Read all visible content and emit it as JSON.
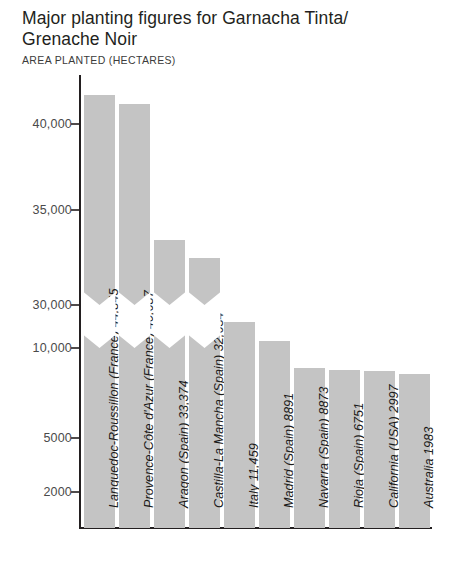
{
  "header": {
    "title": "Major planting figures for Garnacha Tinta/\nGrenache Noir",
    "subtitle": "AREA PLANTED (HECTARES)"
  },
  "colors": {
    "bar_fill": "#c4c4c4",
    "axis": "#231f20",
    "tick_label": "#4a4a4a",
    "background": "#ffffff",
    "title": "#231f20"
  },
  "axis": {
    "y_ticks": [
      {
        "label": "40,000",
        "value": 40000,
        "y": 124
      },
      {
        "label": "35,000",
        "value": 35000,
        "y": 210
      },
      {
        "label": "30,000",
        "value": 30000,
        "y": 305
      },
      {
        "label": "10,000",
        "value": 10000,
        "y": 348
      },
      {
        "label": "5000",
        "value": 5000,
        "y": 438
      },
      {
        "label": "2000",
        "value": 2000,
        "y": 492
      }
    ],
    "baseline_y": 528,
    "axis_top_y": 75,
    "axis_x": 80,
    "broken": true,
    "break_between": [
      10000,
      30000
    ]
  },
  "chart_data": {
    "type": "bar",
    "subtitle": "AREA PLANTED (HECTARES)",
    "xlabel": "",
    "ylabel": "AREA PLANTED (HECTARES)",
    "grid": false,
    "legend": "none",
    "axis_break": {
      "from": 10000,
      "to": 30000
    },
    "ytick_labels": [
      "2000",
      "5000",
      "10,000",
      "30,000",
      "35,000",
      "40,000"
    ],
    "categories": [
      "Languedoc-Roussillon (France)",
      "Provence-Côte d'Azur (France)",
      "Aragon (Spain)",
      "Castilla-La Mancha (Spain)",
      "Italy",
      "Madrid (Spain)",
      "Navarra (Spain)",
      "Rioja (Spain)",
      "California (USA)",
      "Australia"
    ],
    "values": [
      44845,
      40687,
      33374,
      32634,
      11459,
      8891,
      8873,
      6751,
      2997,
      1983
    ],
    "value_labels": [
      "44,845",
      "40,687",
      "33,374",
      "32,634",
      "11,459",
      "8891",
      "8873",
      "6751",
      "2997",
      "1983"
    ]
  },
  "bars": [
    {
      "label": "Languedoc-Roussillon (France) 44,845",
      "value": 44845,
      "x": 84,
      "width": 31,
      "top": 95,
      "broken": true
    },
    {
      "label": "Provence-Côte d'Azur (France) 40,687",
      "value": 40687,
      "x": 119,
      "width": 31,
      "top": 104,
      "broken": true
    },
    {
      "label": "Aragon (Spain) 33,374",
      "value": 33374,
      "x": 154,
      "width": 31,
      "top": 240,
      "broken": true
    },
    {
      "label": "Castilla-La Mancha (Spain) 32,634",
      "value": 32634,
      "x": 189,
      "width": 31,
      "top": 258,
      "broken": true
    },
    {
      "label": "Italy 11,459",
      "value": 11459,
      "x": 224,
      "width": 31,
      "top": 322,
      "broken": false
    },
    {
      "label": "Madrid (Spain) 8891",
      "value": 8891,
      "x": 259,
      "width": 31,
      "top": 341,
      "broken": false
    },
    {
      "label": "Navarra (Spain) 8873",
      "value": 8873,
      "x": 294,
      "width": 31,
      "top": 368,
      "broken": false
    },
    {
      "label": "Rioja (Spain) 6751",
      "value": 6751,
      "x": 329,
      "width": 31,
      "top": 370,
      "broken": false
    },
    {
      "label": "California (USA) 2997",
      "value": 2997,
      "x": 364,
      "width": 31,
      "top": 371,
      "broken": false
    },
    {
      "label": "Australia 1983",
      "value": 1983,
      "x": 399,
      "width": 31,
      "top": 374,
      "broken": false
    }
  ]
}
